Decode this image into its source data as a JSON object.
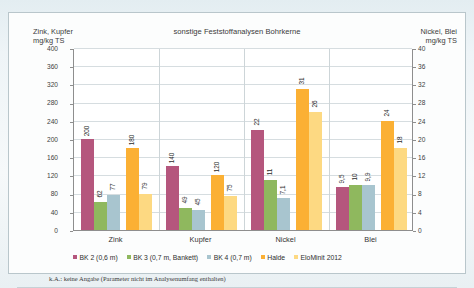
{
  "chart_data": {
    "type": "bar",
    "title": "sonstige Feststoffanalysen Bohrkerne",
    "categories": [
      "Zink",
      "Kupfer",
      "Nickel",
      "Blei"
    ],
    "series": [
      {
        "name": "BK 2 (0,6 m)",
        "color": "#b5567d",
        "values": [
          200,
          140,
          22,
          9.5
        ],
        "labels": [
          "200",
          "140",
          "22",
          "9,5"
        ]
      },
      {
        "name": "BK 3 (0,7 m, Bankett)",
        "color": "#8fb85e",
        "values": [
          62,
          49,
          11,
          10
        ],
        "labels": [
          "62",
          "49",
          "11",
          "10"
        ]
      },
      {
        "name": "BK 4 (0,7 m)",
        "color": "#a8c5cf",
        "values": [
          77,
          45,
          7.1,
          9.9
        ],
        "labels": [
          "77",
          "45",
          "7,1",
          "9,9"
        ]
      },
      {
        "name": "Halde",
        "color": "#fbb034",
        "values": [
          180,
          120,
          31,
          24
        ],
        "labels": [
          "180",
          "120",
          "31",
          "24"
        ]
      },
      {
        "name": "EloMinit 2012",
        "color": "#fdd982",
        "values": [
          79,
          75,
          26,
          18
        ],
        "labels": [
          "79",
          "75",
          "26",
          "18"
        ]
      }
    ],
    "left_axis": {
      "label": "Zink, Kupfer\nmg/kg TS",
      "ticks": [
        0,
        40,
        80,
        120,
        160,
        200,
        240,
        280,
        320,
        360,
        400
      ],
      "ylim": [
        0,
        400
      ],
      "applies_to": [
        "Zink",
        "Kupfer"
      ]
    },
    "right_axis": {
      "label": "Nickel, Blei\nmg/kg TS",
      "ticks": [
        0,
        4,
        8,
        12,
        16,
        20,
        24,
        28,
        32,
        36,
        40
      ],
      "ylim": [
        0,
        40
      ],
      "applies_to": [
        "Nickel",
        "Blei"
      ]
    },
    "grid": true,
    "legend_position": "bottom",
    "xlabel": "",
    "ylabel": "mg/kg TS"
  },
  "footnote": "k.A.: keine Angabe (Parameter nicht im Analysenumfang enthalten)"
}
